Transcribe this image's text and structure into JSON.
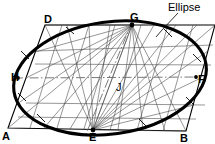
{
  "figure": {
    "callout": {
      "label": "Ellipse",
      "x": 168,
      "y": 2
    },
    "colors": {
      "ellipse_stroke": "#000000",
      "construction_stroke": "#3a3a3a",
      "parallelogram_stroke": "#000000",
      "centerline_stroke": "#6e6e6e",
      "background": "#ffffff"
    },
    "labels": [
      {
        "id": "D",
        "text": "D",
        "x": 44,
        "y": 14
      },
      {
        "id": "G",
        "text": "G",
        "x": 130,
        "y": 12
      },
      {
        "id": "H",
        "text": "H",
        "x": 11,
        "y": 72
      },
      {
        "id": "F",
        "text": "F",
        "x": 198,
        "y": 74
      },
      {
        "id": "J",
        "text": "J",
        "x": 116,
        "y": 82
      },
      {
        "id": "A",
        "text": "A",
        "x": 2,
        "y": 131
      },
      {
        "id": "E",
        "text": "E",
        "x": 89,
        "y": 132
      },
      {
        "id": "B",
        "text": "B",
        "x": 180,
        "y": 133
      }
    ],
    "parallelogram": {
      "name": "bounding-parallelogram",
      "vertices": [
        {
          "id": "A",
          "x": 8,
          "y": 128
        },
        {
          "id": "B",
          "x": 186,
          "y": 131
        },
        {
          "id": "C",
          "x": 215,
          "y": 25
        },
        {
          "id": "D",
          "x": 45,
          "y": 25
        }
      ]
    },
    "ellipse": {
      "name": "inscribed-ellipse",
      "center": {
        "x": 110,
        "y": 78
      },
      "semi_major": 97,
      "semi_minor": 56,
      "rotation_deg": -8
    },
    "axis_points": {
      "H": {
        "x": 18,
        "y": 78
      },
      "F": {
        "x": 196,
        "y": 77
      },
      "G": {
        "x": 132,
        "y": 25
      },
      "E": {
        "x": 93,
        "y": 130
      },
      "J": {
        "x": 110,
        "y": 78
      }
    },
    "tick_marks": [
      {
        "x": 70,
        "y": 30
      },
      {
        "x": 168,
        "y": 33
      },
      {
        "x": 197,
        "y": 58
      },
      {
        "x": 190,
        "y": 101
      },
      {
        "x": 143,
        "y": 123
      },
      {
        "x": 41,
        "y": 118
      },
      {
        "x": 22,
        "y": 97
      },
      {
        "x": 25,
        "y": 55
      }
    ],
    "construction": {
      "description": "Radial construction lines from E and G to division points on the parallelogram sides",
      "side_divisions_left": 4,
      "side_divisions_right": 4,
      "side_divisions_top": 4,
      "side_divisions_bottom": 4
    }
  }
}
